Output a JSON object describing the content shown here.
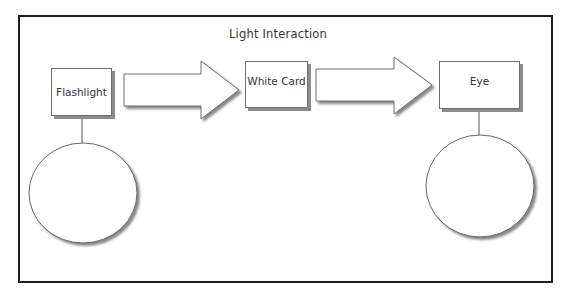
{
  "diagram": {
    "title": "Light Interaction",
    "nodes": [
      {
        "id": "flashlight",
        "label": "Flashlight"
      },
      {
        "id": "white-card",
        "label": "White Card"
      },
      {
        "id": "eye",
        "label": "Eye"
      }
    ],
    "edges": [
      {
        "from": "flashlight",
        "to": "white-card",
        "shape": "block-arrow"
      },
      {
        "from": "white-card",
        "to": "eye",
        "shape": "block-arrow"
      }
    ],
    "attachments": [
      {
        "node": "flashlight",
        "shape": "ellipse",
        "label": ""
      },
      {
        "node": "eye",
        "shape": "ellipse",
        "label": ""
      }
    ],
    "colors": {
      "border": "#1e1e1e",
      "stroke": "#6e6e6e",
      "shadow": "#8c8c8c",
      "fill": "#ffffff",
      "text": "#333333"
    }
  }
}
